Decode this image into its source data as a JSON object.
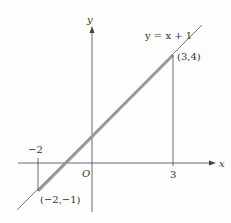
{
  "diagram": {
    "equation_label": "y = x + 1",
    "axes": {
      "x_label": "x",
      "y_label": "y",
      "origin_label": "O"
    },
    "points": [
      {
        "label": "(3,4)",
        "x": 3,
        "y": 4
      },
      {
        "label": "(−2,−1)",
        "x": -2,
        "y": -1
      }
    ],
    "ticks": [
      {
        "label": "3",
        "x": 3
      },
      {
        "label": "−2",
        "x": -2
      }
    ],
    "colors": {
      "line": "#555555",
      "segment": "#9a9a9a",
      "axis": "#444444"
    }
  }
}
